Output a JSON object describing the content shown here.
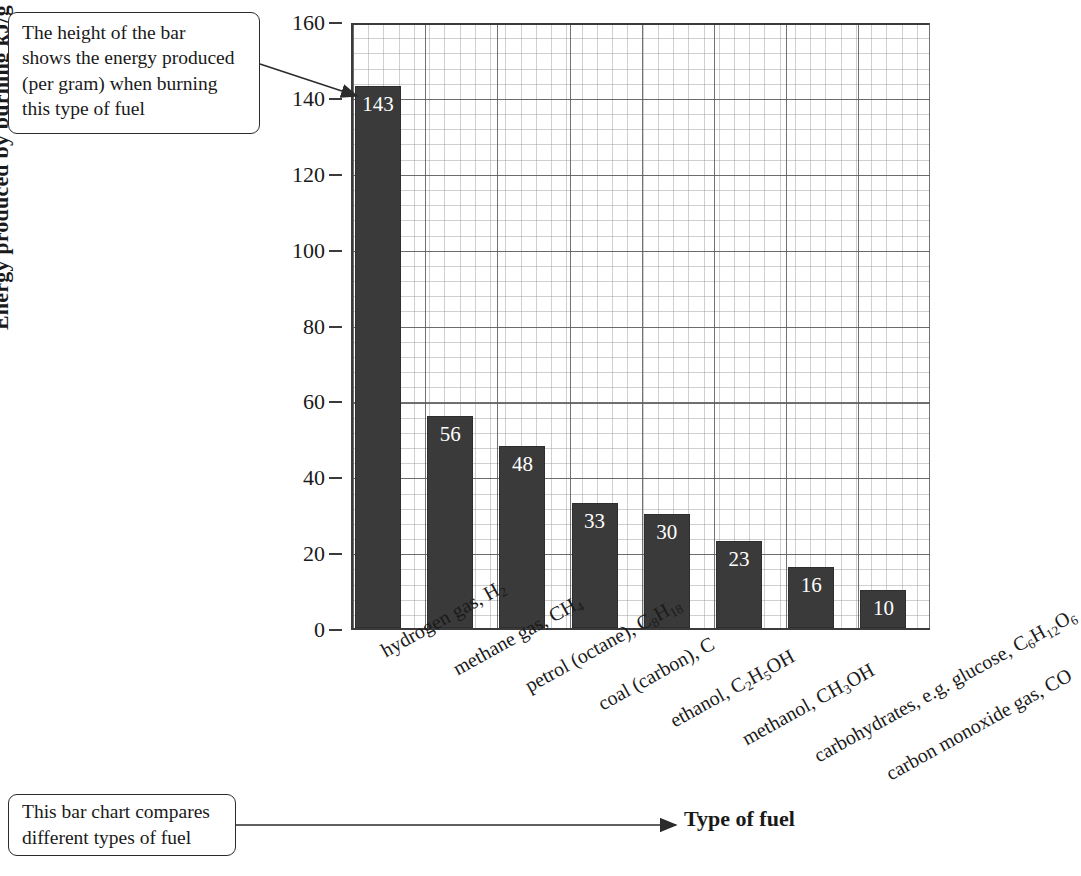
{
  "chart_data": {
    "type": "bar",
    "title": "",
    "xlabel": "Type of fuel",
    "ylabel": "Energy produced by burning kJ/g",
    "ylim": [
      0,
      160
    ],
    "ytick_step": 20,
    "yticks": [
      0,
      20,
      40,
      60,
      80,
      100,
      120,
      140,
      160
    ],
    "grid": true,
    "legend": "none",
    "bar_color": "#3a3a3a",
    "value_label_color": "#ffffff",
    "categories": [
      "hydrogen gas, H2",
      "methane gas, CH4",
      "petrol (octane), C8H18",
      "coal (carbon), C",
      "ethanol, C2H5OH",
      "methanol, CH3OH",
      "carbohydrates, e.g. glucose, C6H12O6",
      "carbon monoxide gas, CO"
    ],
    "categories_html": [
      "hydrogen gas, H<sub>2</sub>",
      "methane gas, CH<sub>4</sub>",
      "petrol (octane), C<sub>8</sub>H<sub>18</sub>",
      "coal (carbon), C",
      "ethanol, C<sub>2</sub>H<sub>5</sub>OH",
      "methanol, CH<sub>3</sub>OH",
      "carbohydrates, e.g. glucose, C<sub>6</sub>H<sub>12</sub>O<sub>6</sub>",
      "carbon monoxide gas, CO"
    ],
    "values": [
      143,
      56,
      48,
      33,
      30,
      23,
      16,
      10
    ]
  },
  "annotations": {
    "top_callout": "The height of the bar\nshows the energy produced\n(per gram) when burning\nthis type of fuel",
    "bottom_callout": "This bar chart compares\ndifferent types of fuel"
  }
}
